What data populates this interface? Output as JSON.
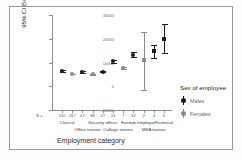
{
  "chart_data": {
    "type": "scatter",
    "title": "",
    "xlabel": "Employment category",
    "ylabel": "95% CI Beginning salary",
    "ylim": [
      -10000,
      30000
    ],
    "yticks": [
      30000,
      20000,
      10000,
      0,
      -10000
    ],
    "ytick_labels": [
      "30000",
      "20000",
      "10000",
      "0",
      "-10000"
    ],
    "grid": false,
    "legend_position": "right",
    "legend_title": "Sex of employee",
    "n_label": "N =",
    "categories": [
      "Clerical",
      "Office trainee",
      "Security officer",
      "College trainee",
      "Exempt employee",
      "MBA trainee",
      "Technical"
    ],
    "series": [
      {
        "name": "Males",
        "color": "#1c1c1c",
        "points": [
          {
            "category": "Clerical",
            "n": "110",
            "mean": 6553,
            "low": 6180,
            "high": 6930
          },
          {
            "category": "Office trainee",
            "n": "47",
            "mean": 6032,
            "low": 5720,
            "high": 6345
          },
          {
            "category": "Security officer",
            "n": "27",
            "mean": 6031,
            "low": 5840,
            "high": 6225
          },
          {
            "category": "College trainee",
            "n": "24",
            "mean": 10468,
            "low": 9760,
            "high": 11180
          },
          {
            "category": "Exempt employee",
            "n": "32",
            "mean": 13255,
            "low": 12280,
            "high": 14230
          },
          {
            "category": "MBA trainee",
            "n": "4",
            "mean": 14700,
            "low": 11950,
            "high": 17450
          },
          {
            "category": "Technical",
            "n": "6",
            "mean": 20000,
            "low": 13900,
            "high": 26100
          }
        ]
      },
      {
        "name": "Females",
        "color": "#8c8c8c",
        "points": [
          {
            "category": "Clerical",
            "n": "157",
            "mean": 5138,
            "low": 4980,
            "high": 5300
          },
          {
            "category": "Office trainee",
            "n": "88",
            "mean": 5047,
            "low": 4900,
            "high": 5195
          },
          {
            "category": "College trainee",
            "n": "7",
            "mean": 7612,
            "low": 7150,
            "high": 8075
          },
          {
            "category": "Exempt employee",
            "n": "2",
            "mean": 11250,
            "low": -1600,
            "high": 22800
          }
        ]
      }
    ]
  },
  "axis": {
    "ytick_labels": [
      "30000",
      "20000",
      "10000",
      "0",
      "-10000"
    ],
    "xtitle": "Employment category",
    "ytitle": "95% CI Beginning salary",
    "n_prefix": "N ="
  },
  "nrow": [
    {
      "text": "110"
    },
    {
      "text": "157"
    },
    {
      "text": "47"
    },
    {
      "text": "88"
    },
    {
      "text": "27"
    },
    {
      "text": "24"
    },
    {
      "text": "7"
    },
    {
      "text": "32"
    },
    {
      "text": "2"
    },
    {
      "text": "4"
    },
    {
      "text": "6"
    }
  ],
  "cat_row1": [
    {
      "text": "Clerical"
    },
    {
      "text": "Security officer"
    },
    {
      "text": "Exempt employee"
    },
    {
      "text": "Technical"
    }
  ],
  "cat_row2": [
    {
      "text": "Office trainee"
    },
    {
      "text": "College trainee"
    },
    {
      "text": "MBA trainee"
    }
  ],
  "legend": {
    "title": "Sex of employee",
    "items": [
      {
        "label": "Males"
      },
      {
        "label": "Females"
      }
    ]
  }
}
